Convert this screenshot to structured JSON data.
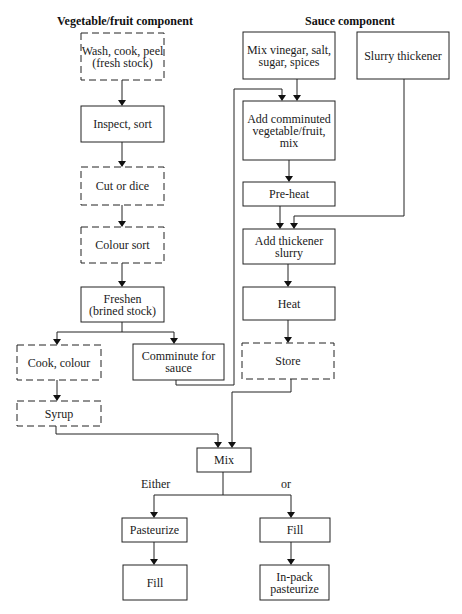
{
  "headers": {
    "vegetable": "Vegetable/fruit component",
    "sauce": "Sauce component"
  },
  "legend": {
    "solid_box": "step",
    "dashed_box": "optional step"
  },
  "nodes": {
    "wash": {
      "label": "Wash, cook, peel (fresh stock)",
      "style": "dashed"
    },
    "inspect": {
      "label": "Inspect, sort",
      "style": "solid"
    },
    "cut": {
      "label": "Cut or dice",
      "style": "dashed"
    },
    "colour_sort": {
      "label": "Colour sort",
      "style": "dashed"
    },
    "freshen": {
      "label": "Freshen (brined stock)",
      "style": "solid"
    },
    "cook_colour": {
      "label": "Cook, colour",
      "style": "dashed"
    },
    "comminute": {
      "label": "Comminute for sauce",
      "style": "solid"
    },
    "syrup": {
      "label": "Syrup",
      "style": "dashed"
    },
    "mix_vinegar": {
      "label": "Mix vinegar, salt, sugar, spices",
      "style": "solid"
    },
    "slurry": {
      "label": "Slurry thickener",
      "style": "solid"
    },
    "add_comminuted": {
      "label": "Add comminuted vegetable/fruit, mix",
      "style": "solid"
    },
    "preheat": {
      "label": "Pre-heat",
      "style": "solid"
    },
    "add_thickener": {
      "label": "Add thickener slurry",
      "style": "solid"
    },
    "heat": {
      "label": "Heat",
      "style": "solid"
    },
    "store": {
      "label": "Store",
      "style": "dashed"
    },
    "mix": {
      "label": "Mix",
      "style": "solid"
    },
    "pasteurize": {
      "label": "Pasteurize",
      "style": "solid"
    },
    "fill_left": {
      "label": "Fill",
      "style": "solid"
    },
    "fill_right": {
      "label": "Fill",
      "style": "solid"
    },
    "inpack": {
      "label": "In-pack pasteurize",
      "style": "solid"
    }
  },
  "branch_labels": {
    "either": "Either",
    "or": "or"
  },
  "edges": [
    [
      "wash",
      "inspect"
    ],
    [
      "inspect",
      "cut"
    ],
    [
      "cut",
      "colour_sort"
    ],
    [
      "colour_sort",
      "freshen"
    ],
    [
      "freshen",
      "cook_colour"
    ],
    [
      "freshen",
      "comminute"
    ],
    [
      "cook_colour",
      "syrup"
    ],
    [
      "comminute",
      "add_comminuted"
    ],
    [
      "mix_vinegar",
      "add_comminuted"
    ],
    [
      "add_comminuted",
      "preheat"
    ],
    [
      "preheat",
      "add_thickener"
    ],
    [
      "slurry",
      "add_thickener"
    ],
    [
      "add_thickener",
      "heat"
    ],
    [
      "heat",
      "store"
    ],
    [
      "syrup",
      "mix"
    ],
    [
      "store",
      "mix"
    ],
    [
      "mix",
      "pasteurize"
    ],
    [
      "mix",
      "fill_right"
    ],
    [
      "pasteurize",
      "fill_left"
    ],
    [
      "fill_right",
      "inpack"
    ]
  ]
}
